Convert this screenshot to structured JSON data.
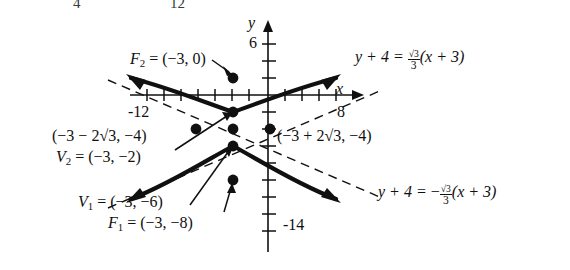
{
  "figure": {
    "type": "hyperbola-graph",
    "axes": {
      "x_axis_label": "x",
      "y_axis_label": "y",
      "x_ticks_labeled": [
        "-12",
        "8"
      ],
      "y_ticks_labeled": [
        "6",
        "-14"
      ],
      "x_range": [
        -16,
        10
      ],
      "y_range": [
        -16,
        7
      ],
      "tick_step": 2
    },
    "labels": {
      "focus_upper": "F₂ = (−3, 0)",
      "focus_upper_name": "F",
      "focus_upper_sub": "2",
      "focus_upper_rest": " = (−3, 0)",
      "vertex_upper_name": "V",
      "vertex_upper_sub": "2",
      "vertex_upper_rest": " = (−3, −2)",
      "vertex_lower_name": "V",
      "vertex_lower_sub": "1",
      "vertex_lower_rest": " = (−3, −6)",
      "focus_lower_name": "F",
      "focus_lower_sub": "1",
      "focus_lower_rest": " = (−3, −8)",
      "point_left": "(−3 − 2√3, −4)",
      "point_right": "(−3 + 2√3, −4)"
    },
    "asymptotes": {
      "positive": {
        "lhs": "y + 4 = ",
        "sign": "",
        "num": "√3",
        "den": "3",
        "rhs": "(x + 3)",
        "full": "y + 4 = (√3/3)(x + 3)"
      },
      "negative": {
        "lhs": "y + 4 = ",
        "sign": "−",
        "num": "√3",
        "den": "3",
        "rhs": "(x + 3)",
        "full": "y + 4 = −(√3/3)(x + 3)"
      }
    },
    "points": [
      {
        "name": "F2",
        "coords": "(-3, 0)"
      },
      {
        "name": "V2",
        "coords": "(-3, -2)"
      },
      {
        "name": "center-left",
        "coords": "(-3-2√3, -4)"
      },
      {
        "name": "center",
        "coords": "(-3, -4)"
      },
      {
        "name": "center-right",
        "coords": "(-3+2√3, -4)"
      },
      {
        "name": "V1",
        "coords": "(-3, -6)"
      },
      {
        "name": "F1",
        "coords": "(-3, -8)"
      }
    ],
    "cropped_top": {
      "left_fragment": "4",
      "right_fragment": "12"
    },
    "colors": {
      "ink": "#101010",
      "background": "#ffffff"
    }
  }
}
